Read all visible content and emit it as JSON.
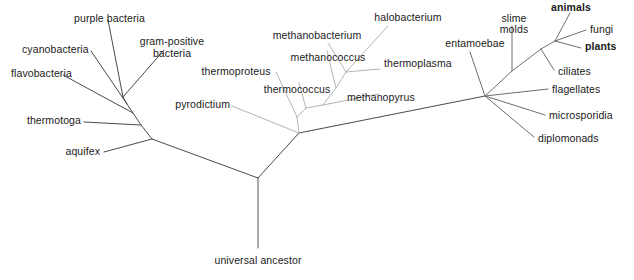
{
  "figure": {
    "background_color": "#ffffff",
    "width": 634,
    "height": 280
  },
  "styles": {
    "bacteria_color": "#4a4a4a",
    "archaea_color": "#b5b5b5",
    "eukaryota_color": "#6e6e6e",
    "root_color": "#555555",
    "label_color": "#1a1a1a",
    "line_width": 1
  },
  "nodes": {
    "universal_ancestor": {
      "x": 258,
      "y": 178
    },
    "root_tip": {
      "x": 258,
      "y": 248
    },
    "bacteria_base": {
      "x": 152,
      "y": 139
    },
    "bacteria_node_b": {
      "x": 141,
      "y": 125
    },
    "bacteria_node_c": {
      "x": 133,
      "y": 113
    },
    "bacteria_node_d": {
      "x": 127,
      "y": 104
    },
    "bacteria_node_e": {
      "x": 123,
      "y": 97
    },
    "archaea_base": {
      "x": 299,
      "y": 133
    },
    "archaea_node_b": {
      "x": 297,
      "y": 117
    },
    "archaea_node_c": {
      "x": 306,
      "y": 108
    },
    "archaea_node_d": {
      "x": 323,
      "y": 105
    },
    "archaea_node_e": {
      "x": 336,
      "y": 88
    },
    "archaea_node_f": {
      "x": 346,
      "y": 72
    },
    "eukaryota_base": {
      "x": 485,
      "y": 96
    },
    "euk_node_b": {
      "x": 512,
      "y": 71
    },
    "euk_node_c": {
      "x": 541,
      "y": 49
    },
    "euk_node_d": {
      "x": 555,
      "y": 41
    }
  },
  "branches": [
    {
      "name": "root-stem",
      "group": "root",
      "from": [
        258,
        178
      ],
      "to": [
        258,
        248
      ]
    },
    {
      "name": "bacteria-trunk",
      "group": "bacteria",
      "from": [
        258,
        178
      ],
      "to": [
        152,
        139
      ]
    },
    {
      "name": "archaea-trunk",
      "group": "archaea_trunk",
      "from": [
        258,
        178
      ],
      "to": [
        299,
        133
      ]
    },
    {
      "name": "eukaryota-trunk",
      "group": "eukaryota_trunk",
      "from": [
        299,
        133
      ],
      "to": [
        485,
        96
      ]
    },
    {
      "name": "bacteria-spine-1",
      "group": "bacteria",
      "from": [
        152,
        139
      ],
      "to": [
        141,
        125
      ]
    },
    {
      "name": "bacteria-spine-2",
      "group": "bacteria",
      "from": [
        141,
        125
      ],
      "to": [
        133,
        113
      ]
    },
    {
      "name": "bacteria-spine-3",
      "group": "bacteria",
      "from": [
        133,
        113
      ],
      "to": [
        127,
        104
      ]
    },
    {
      "name": "bacteria-spine-4",
      "group": "bacteria",
      "from": [
        127,
        104
      ],
      "to": [
        123,
        97
      ]
    },
    {
      "name": "branch-aquifex",
      "group": "bacteria",
      "from": [
        152,
        139
      ],
      "to": [
        104,
        152
      ]
    },
    {
      "name": "branch-thermotoga",
      "group": "bacteria",
      "from": [
        141,
        125
      ],
      "to": [
        84,
        122
      ]
    },
    {
      "name": "branch-flavobacteria",
      "group": "bacteria",
      "from": [
        133,
        113
      ],
      "to": [
        63,
        75
      ]
    },
    {
      "name": "branch-cyanobacteria",
      "group": "bacteria",
      "from": [
        127,
        104
      ],
      "to": [
        91,
        51
      ]
    },
    {
      "name": "branch-purple-bacteria",
      "group": "bacteria",
      "from": [
        123,
        97
      ],
      "to": [
        108,
        20
      ]
    },
    {
      "name": "branch-gram-positive",
      "group": "bacteria",
      "from": [
        123,
        97
      ],
      "to": [
        164,
        50
      ]
    },
    {
      "name": "archaea-spine-1",
      "group": "archaea",
      "from": [
        299,
        133
      ],
      "to": [
        297,
        117
      ]
    },
    {
      "name": "archaea-spine-2",
      "group": "archaea",
      "from": [
        297,
        117
      ],
      "to": [
        306,
        108
      ]
    },
    {
      "name": "archaea-spine-3",
      "group": "archaea",
      "from": [
        306,
        108
      ],
      "to": [
        323,
        105
      ]
    },
    {
      "name": "archaea-spine-4",
      "group": "archaea",
      "from": [
        323,
        105
      ],
      "to": [
        336,
        88
      ]
    },
    {
      "name": "archaea-spine-5",
      "group": "archaea",
      "from": [
        336,
        88
      ],
      "to": [
        346,
        72
      ]
    },
    {
      "name": "branch-pyrodictium",
      "group": "archaea",
      "from": [
        299,
        133
      ],
      "to": [
        232,
        106
      ]
    },
    {
      "name": "branch-thermoproteus",
      "group": "archaea",
      "from": [
        297,
        117
      ],
      "to": [
        276,
        72
      ]
    },
    {
      "name": "branch-thermococcus",
      "group": "archaea",
      "from": [
        306,
        108
      ],
      "to": [
        299,
        83
      ]
    },
    {
      "name": "branch-methanopyrus",
      "group": "archaea",
      "from": [
        323,
        105
      ],
      "to": [
        379,
        94
      ]
    },
    {
      "name": "branch-methanococcus",
      "group": "archaea",
      "from": [
        336,
        88
      ],
      "to": [
        327,
        51
      ]
    },
    {
      "name": "branch-methanobacterium",
      "group": "archaea",
      "from": [
        346,
        72
      ],
      "to": [
        328,
        43
      ]
    },
    {
      "name": "branch-halobacterium",
      "group": "archaea",
      "from": [
        346,
        72
      ],
      "to": [
        388,
        26
      ]
    },
    {
      "name": "branch-thermoplasma",
      "group": "archaea",
      "from": [
        346,
        72
      ],
      "to": [
        380,
        69
      ]
    },
    {
      "name": "euk-spine-1",
      "group": "eukaryota",
      "from": [
        485,
        96
      ],
      "to": [
        512,
        71
      ]
    },
    {
      "name": "euk-spine-2",
      "group": "eukaryota",
      "from": [
        512,
        71
      ],
      "to": [
        541,
        49
      ]
    },
    {
      "name": "euk-spine-3",
      "group": "eukaryota",
      "from": [
        541,
        49
      ],
      "to": [
        555,
        41
      ]
    },
    {
      "name": "branch-diplomonads",
      "group": "eukaryota",
      "from": [
        485,
        96
      ],
      "to": [
        534,
        137
      ]
    },
    {
      "name": "branch-microsporidia",
      "group": "eukaryota",
      "from": [
        485,
        96
      ],
      "to": [
        545,
        115
      ]
    },
    {
      "name": "branch-flagellates",
      "group": "eukaryota",
      "from": [
        485,
        96
      ],
      "to": [
        548,
        89
      ]
    },
    {
      "name": "branch-entamoebae",
      "group": "eukaryota",
      "from": [
        485,
        96
      ],
      "to": [
        470,
        52
      ]
    },
    {
      "name": "branch-slime-molds",
      "group": "eukaryota",
      "from": [
        512,
        71
      ],
      "to": [
        512,
        26
      ]
    },
    {
      "name": "branch-ciliates",
      "group": "eukaryota",
      "from": [
        541,
        49
      ],
      "to": [
        554,
        70
      ]
    },
    {
      "name": "branch-animals",
      "group": "eukaryota",
      "from": [
        555,
        41
      ],
      "to": [
        570,
        13
      ]
    },
    {
      "name": "branch-fungi",
      "group": "eukaryota",
      "from": [
        555,
        41
      ],
      "to": [
        586,
        30
      ]
    },
    {
      "name": "branch-plants",
      "group": "eukaryota",
      "from": [
        555,
        41
      ],
      "to": [
        581,
        48
      ]
    }
  ],
  "labels": {
    "flavobacteria": "flavobacteria",
    "cyanobacteria": "cyanobacteria",
    "purple_bacteria": "purple bacteria",
    "gram_positive_bacteria_line1": "gram-positive",
    "gram_positive_bacteria_line2": "bacteria",
    "thermotoga": "thermotoga",
    "aquifex": "aquifex",
    "pyrodictium": "pyrodictium",
    "thermoproteus": "thermoproteus",
    "thermococcus": "thermococcus",
    "methanococcus": "methanococcus",
    "methanobacterium": "methanobacterium",
    "halobacterium": "halobacterium",
    "thermoplasma": "thermoplasma",
    "methanopyrus": "methanopyrus",
    "entamoebae": "entamoebae",
    "slime_molds_line1": "slime",
    "slime_molds_line2": "molds",
    "animals": "animals",
    "fungi": "fungi",
    "plants": "plants",
    "ciliates": "ciliates",
    "flagellates": "flagellates",
    "microsporidia": "microsporidia",
    "diplomonads": "diplomonads",
    "universal_ancestor": "universal ancestor"
  }
}
